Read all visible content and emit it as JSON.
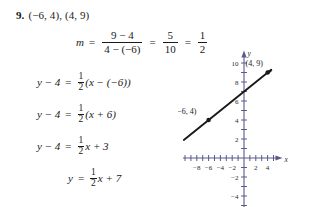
{
  "problem": {
    "number": "9.",
    "points_text": "(−6, 4), (4, 9)"
  },
  "work": {
    "slope": {
      "lhs": "m",
      "eq1": "=",
      "frac1_num": "9 − 4",
      "frac1_den": "4 − (−6)",
      "eq2": "=",
      "frac2_num": "5",
      "frac2_den": "10",
      "eq3": "=",
      "frac3_num": "1",
      "frac3_den": "2"
    },
    "step1": {
      "lhs": "y − 4",
      "eq": "=",
      "frac_num": "1",
      "frac_den": "2",
      "rhs": "(x − (−6))"
    },
    "step2": {
      "lhs": "y − 4",
      "eq": "=",
      "frac_num": "1",
      "frac_den": "2",
      "rhs": "(x + 6)"
    },
    "step3": {
      "lhs": "y − 4",
      "eq": "=",
      "frac_num": "1",
      "frac_den": "2",
      "rhs": "x + 3"
    },
    "step4": {
      "lhs": "y",
      "eq": "=",
      "frac_num": "1",
      "frac_den": "2",
      "rhs": "x + 7"
    }
  },
  "chart_data": {
    "type": "line",
    "title": "",
    "xlabel": "x",
    "ylabel": "y",
    "xlim": [
      -10,
      5
    ],
    "ylim": [
      -5,
      11
    ],
    "x_ticks": [
      -8,
      -6,
      -4,
      -2,
      2,
      4
    ],
    "x_tick_labels": [
      "−8",
      "−6",
      "−4",
      "−2",
      "2",
      "4"
    ],
    "y_ticks": [
      2,
      4,
      6,
      8,
      10,
      -2,
      -4
    ],
    "y_tick_labels": [
      "2",
      "4",
      "6",
      "8",
      "10",
      "−2",
      "−4"
    ],
    "grid": false,
    "line": {
      "equation": "y = (1/2)x + 7",
      "slope": 0.5,
      "intercept": 7,
      "x_from": -10.2,
      "x_to": 4.6,
      "arrow_end": true,
      "color": "#1a1a1a"
    },
    "points": [
      {
        "x": -6,
        "y": 4,
        "label": "(−6, 4)"
      },
      {
        "x": 4,
        "y": 9,
        "label": "(4, 9)"
      }
    ],
    "axis_color": "#5a5a8c"
  }
}
